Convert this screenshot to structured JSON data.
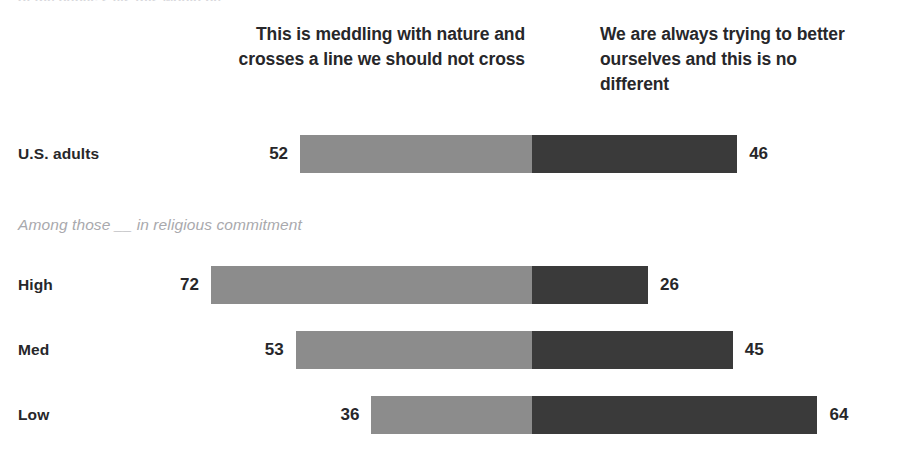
{
  "clipped_header": "of the public says this would be ...",
  "headers": {
    "left": "This is meddling with nature and crosses a line we should not cross",
    "right": "We are always trying to better ourselves and this is no different"
  },
  "section_note": "Among those __ in religious commitment",
  "colors": {
    "left_segment": "#8c8c8c",
    "right_segment": "#3a3a3a",
    "label_text": "#27272a",
    "note_text": "#a9a9ad",
    "background": "#ffffff"
  },
  "rows": [
    {
      "label": "U.S. adults",
      "left": "52",
      "right": "46",
      "left_value": 52,
      "right_value": 46,
      "top": 134
    },
    {
      "label": "High",
      "left": "72",
      "right": "26",
      "left_value": 72,
      "right_value": 26,
      "top": 265
    },
    {
      "label": "Med",
      "left": "53",
      "right": "45",
      "left_value": 53,
      "right_value": 45,
      "top": 330
    },
    {
      "label": "Low",
      "left": "36",
      "right": "64",
      "left_value": 36,
      "right_value": 64,
      "top": 395
    }
  ],
  "chart_data": {
    "type": "bar",
    "subtype": "diverging-stacked-bar",
    "title": "",
    "subtitle": "",
    "section_note": "Among those __ in religious commitment",
    "categories": [
      "U.S. adults",
      "High",
      "Med",
      "Low"
    ],
    "series": [
      {
        "name": "This is meddling with nature and crosses a line we should not cross",
        "values": [
          52,
          72,
          53,
          36
        ],
        "color": "#8c8c8c",
        "side": "left"
      },
      {
        "name": "We are always trying to better ourselves and this is no different",
        "values": [
          46,
          26,
          45,
          64
        ],
        "color": "#3a3a3a",
        "side": "right"
      }
    ],
    "data_labels": true,
    "grid": false,
    "legend_position": "top",
    "xlabel": "",
    "ylabel": "",
    "units": "%",
    "center_at": 0,
    "pixels_per_unit": 4.46,
    "divider_x": 532
  }
}
